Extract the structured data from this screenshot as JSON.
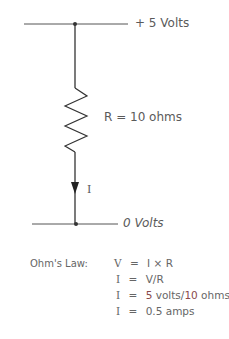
{
  "circuit": {
    "top_rail_label": "+ 5 Volts",
    "bottom_rail_label": "0 Volts",
    "resistor_label": "R = 10 ohms",
    "current_label": "I"
  },
  "ohms_law": {
    "title": "Ohm's Law:",
    "equations": [
      {
        "lhs": "V",
        "eq": "=",
        "rhs": "I × R"
      },
      {
        "lhs": "I",
        "eq": "=",
        "rhs": "V/R"
      },
      {
        "lhs": "I",
        "eq": "=",
        "rhs_value1": "5",
        "rhs_mid": " volts/",
        "rhs_value2": "10",
        "rhs_end": " ohms"
      },
      {
        "lhs": "I",
        "eq": "=",
        "rhs": "0.5 amps"
      }
    ]
  },
  "colors": {
    "line": "#333333",
    "text": "#5a5a5a",
    "highlight": "#8a4a4a"
  }
}
